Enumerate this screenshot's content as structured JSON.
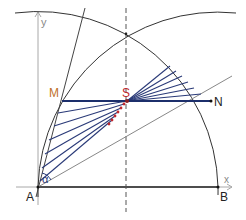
{
  "colors": {
    "arc": "#333333",
    "axis": "#999999",
    "chord": "#1c2f6b",
    "fan": "#2a3a78",
    "point_S": "#c0282d",
    "label_M": "#c0702a",
    "label_S": "#c0282d",
    "label_default": "#222222",
    "dots": "#c0282d"
  },
  "labels": {
    "A": "A",
    "B": "B",
    "M": "M",
    "N": "N",
    "S": "S",
    "x_axis": "x",
    "y_axis": "y",
    "angle": "α"
  },
  "points": {
    "A": [
      38,
      187
    ],
    "B": [
      218,
      187
    ],
    "M": [
      62,
      101
    ],
    "S": [
      127,
      101
    ],
    "N": [
      211,
      101
    ]
  }
}
